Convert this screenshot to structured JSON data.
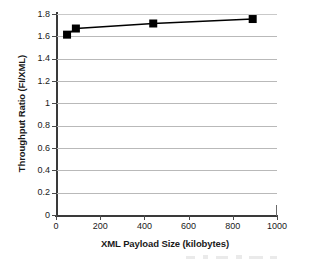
{
  "chart_data": {
    "type": "line",
    "title": "",
    "xlabel": "XML Payload Size (kilobytes)",
    "ylabel": "Throughput Ratio (FI/XML)",
    "xlim": [
      0,
      1000
    ],
    "ylim": [
      0,
      1.8
    ],
    "grid": "horizontal",
    "legend": "none",
    "marker": "filled-square",
    "line_color": "#000000",
    "marker_color": "#000000",
    "gridline_color": "#b9b9b9",
    "x": [
      50,
      90,
      440,
      890
    ],
    "y": [
      1.615,
      1.67,
      1.715,
      1.755
    ],
    "series": [
      {
        "name": "Throughput Ratio (FI/XML)",
        "points": [
          {
            "x": 50,
            "y": 1.615
          },
          {
            "x": 90,
            "y": 1.67
          },
          {
            "x": 440,
            "y": 1.715
          },
          {
            "x": 890,
            "y": 1.755
          }
        ]
      }
    ],
    "xticks": [
      0,
      200,
      400,
      600,
      800,
      1000
    ],
    "xtick_labels": [
      "0",
      "200",
      "400",
      "600",
      "800",
      "1000"
    ],
    "yticks": [
      0,
      0.2,
      0.4,
      0.6,
      0.8,
      1.0,
      1.2,
      1.4,
      1.6,
      1.8
    ],
    "ytick_labels": [
      "0",
      "0.2",
      "0.4",
      "0.6",
      "0.8",
      "1",
      "1.2",
      "1.4",
      "1.6",
      "1.8"
    ]
  }
}
